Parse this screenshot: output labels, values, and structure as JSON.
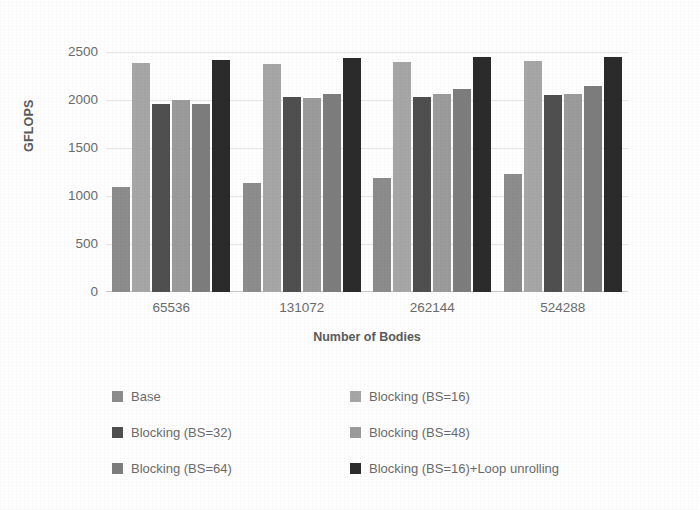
{
  "chart_data": {
    "type": "bar",
    "title": "",
    "subtitle": "",
    "xlabel": "Number of Bodies",
    "ylabel": "GFLOPS",
    "categories": [
      "65536",
      "131072",
      "262144",
      "524288"
    ],
    "ylim": [
      0,
      2500
    ],
    "yticks": [
      2500,
      2000,
      1500,
      1000,
      500,
      0
    ],
    "ytick_labels": [
      "2500",
      "2000",
      "1500",
      "1000",
      "500",
      "0"
    ],
    "grid": true,
    "grid_axis": "y",
    "legend_position": "bottom",
    "legend_columns": 2,
    "series": [
      {
        "name": "Base",
        "color": "#8c8c8c",
        "values": [
          1090,
          1140,
          1190,
          1225
        ]
      },
      {
        "name": "Blocking (BS=16)",
        "color": "#a6a6a6",
        "values": [
          2390,
          2380,
          2395,
          2410
        ]
      },
      {
        "name": "Blocking (BS=32)",
        "color": "#4f4f4f",
        "values": [
          1960,
          2030,
          2035,
          2055
        ]
      },
      {
        "name": "Blocking (BS=48)",
        "color": "#9b9b9b",
        "values": [
          1995,
          2020,
          2060,
          2060
        ]
      },
      {
        "name": "Blocking (BS=64)",
        "color": "#7d7d7d",
        "values": [
          1960,
          2060,
          2115,
          2145
        ]
      },
      {
        "name": "Blocking (BS=16)+Loop unrolling",
        "color": "#2b2b2b",
        "values": [
          2415,
          2435,
          2450,
          2450
        ]
      }
    ]
  },
  "axes": {
    "ylabel": "GFLOPS",
    "xlabel": "Number of Bodies"
  },
  "colors": {
    "gridline": "#e4e4e4",
    "axisline": "#c9c9c9",
    "text": "#6b6b6b",
    "background": "#fefefe"
  }
}
